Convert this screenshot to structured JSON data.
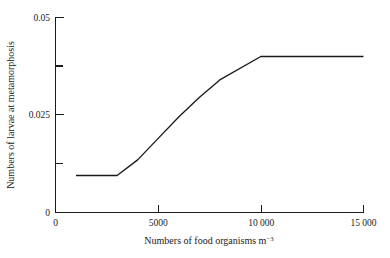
{
  "chart_data": {
    "type": "line",
    "title": "",
    "xlabel": "Numbers of food organisms m",
    "xlabel_sup": "−3",
    "ylabel": "Numbers of larvae at metamorphosis",
    "xlim": [
      0,
      15000
    ],
    "ylim": [
      0,
      0.05
    ],
    "grid": false,
    "legend": null,
    "x_ticks": [
      {
        "value": 0,
        "label": "0",
        "type": "major"
      },
      {
        "value": 5000,
        "label": "5000",
        "type": "major"
      },
      {
        "value": 10000,
        "label": "10 000",
        "type": "major"
      },
      {
        "value": 15000,
        "label": "15 000",
        "type": "major"
      }
    ],
    "y_ticks": [
      {
        "value": 0,
        "label": "0",
        "type": "major"
      },
      {
        "value": 0.0125,
        "label": "",
        "type": "minor"
      },
      {
        "value": 0.025,
        "label": "0.025",
        "type": "major"
      },
      {
        "value": 0.0375,
        "label": "",
        "type": "minor"
      },
      {
        "value": 0.05,
        "label": "0.05",
        "type": "major"
      }
    ],
    "series": [
      {
        "name": "larvae-metamorphosis-response",
        "x": [
          1000,
          3000,
          4000,
          5000,
          6000,
          7000,
          8000,
          10000,
          15000
        ],
        "y": [
          0.0095,
          0.0095,
          0.0135,
          0.019,
          0.0245,
          0.0295,
          0.034,
          0.04,
          0.04
        ]
      }
    ]
  }
}
